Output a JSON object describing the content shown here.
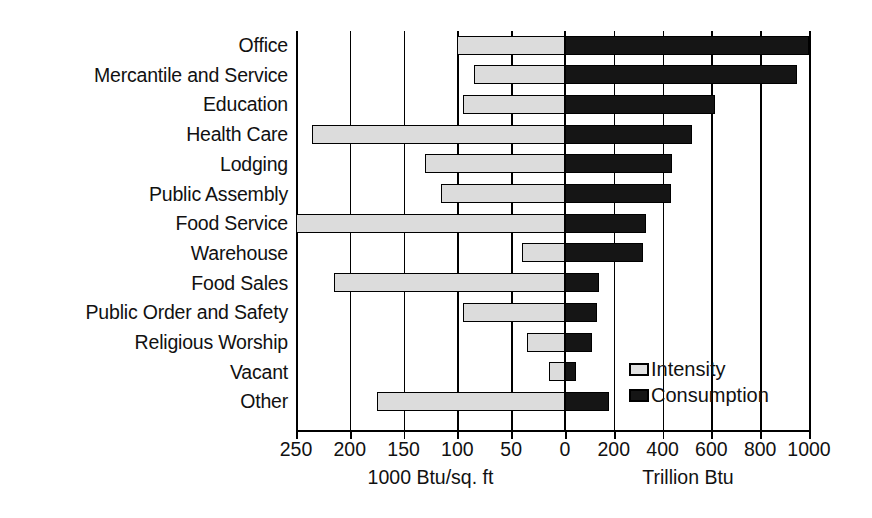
{
  "chart_data": {
    "type": "bar",
    "orientation": "horizontal",
    "subtype": "bidirectional-paired-bar",
    "title": "",
    "categories": [
      "Office",
      "Mercantile and Service",
      "Education",
      "Health Care",
      "Lodging",
      "Public Assembly",
      "Food Service",
      "Warehouse",
      "Food Sales",
      "Public Order and Safety",
      "Religious Worship",
      "Vacant",
      "Other"
    ],
    "series": [
      {
        "name": "Intensity",
        "unit": "1000 Btu/sq. ft",
        "side": "left",
        "color": "#dcdcdc",
        "values": [
          100,
          85,
          95,
          235,
          130,
          115,
          250,
          40,
          215,
          95,
          35,
          15,
          175
        ]
      },
      {
        "name": "Consumption",
        "unit": "Trillion Btu",
        "side": "right",
        "color": "#151515",
        "values": [
          1000,
          950,
          615,
          520,
          440,
          435,
          330,
          320,
          140,
          130,
          110,
          45,
          180
        ]
      }
    ],
    "left_axis": {
      "label": "1000 Btu/sq. ft",
      "ticks": [
        250,
        200,
        150,
        100,
        50,
        0
      ],
      "tick_labels": [
        "250",
        "200",
        "150",
        "100",
        "50",
        "0"
      ],
      "min": 0,
      "max": 250,
      "direction": "reversed"
    },
    "right_axis": {
      "label": "Trillion Btu",
      "ticks": [
        0,
        200,
        400,
        600,
        800,
        1000
      ],
      "tick_labels": [
        "0",
        "200",
        "400",
        "600",
        "800",
        "1000"
      ],
      "min": 0,
      "max": 1000,
      "direction": "normal"
    },
    "grid": true,
    "legend": {
      "position": "bottom-right",
      "entries": [
        {
          "label": "Intensity",
          "swatch": "light-gray-outlined"
        },
        {
          "label": "Consumption",
          "swatch": "black-filled"
        }
      ]
    },
    "colors": {
      "intensity_fill": "#dcdcdc",
      "consumption_fill": "#151515",
      "outline": "#000000",
      "background": "#ffffff"
    }
  }
}
